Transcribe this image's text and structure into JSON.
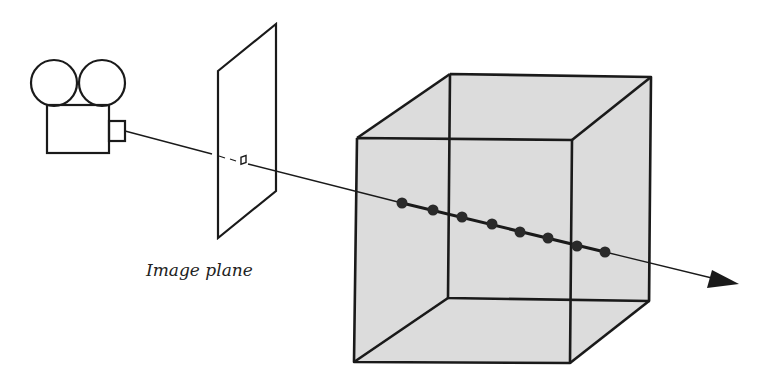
{
  "diagram": {
    "type": "ray-marching-volume-rendering",
    "labels": {
      "image_plane": "Image plane"
    },
    "components": {
      "camera": "camera-icon",
      "image_plane": "rectangle-parallelogram",
      "ray": "arrow-line",
      "volume": "shaded-cube",
      "samples": 8
    },
    "colors": {
      "stroke": "#1a1a1a",
      "cube_fill": "#dcdcdc",
      "sample_dot": "#2a2a2a",
      "background": "#ffffff"
    }
  }
}
